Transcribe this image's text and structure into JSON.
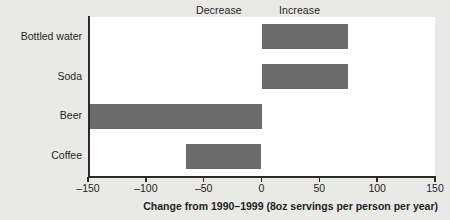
{
  "chart_data": {
    "type": "bar",
    "orientation": "horizontal",
    "title": "",
    "xlabel": "Change from 1990–1999 (8oz servings per person per year)",
    "ylabel": "",
    "categories": [
      "Bottled water",
      "Soda",
      "Beer",
      "Coffee"
    ],
    "values": [
      75,
      75,
      -150,
      -65
    ],
    "xlim": [
      -150,
      150
    ],
    "xticks": [
      -150,
      -100,
      -50,
      0,
      50,
      100,
      150
    ],
    "xtick_labels": [
      "–150",
      "–100",
      "–50",
      "0",
      "50",
      "100",
      "150"
    ],
    "grid": false,
    "legend": false,
    "annotations": [
      {
        "text": "Decrease",
        "side": "left"
      },
      {
        "text": "Increase",
        "side": "right"
      }
    ],
    "series": [
      {
        "name": "Change in 8oz servings per person per year",
        "values": [
          75,
          75,
          -150,
          -65
        ]
      }
    ],
    "colors": {
      "bar": "#6b6b6b",
      "axis": "#2c2927",
      "text": "#231f1e",
      "plot_background": "#ffffff",
      "page_background": "#e9e9e7"
    }
  }
}
